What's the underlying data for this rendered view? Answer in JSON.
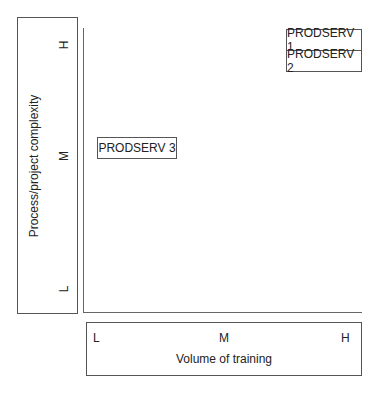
{
  "diagram": {
    "y_axis": {
      "label": "Process/project complexity",
      "ticks": [
        "H",
        "M",
        "L"
      ]
    },
    "x_axis": {
      "label": "Volume of training",
      "ticks": [
        "L",
        "M",
        "H"
      ]
    },
    "items": [
      {
        "label": "PRODSERV 1",
        "x": "H",
        "y": "H"
      },
      {
        "label": "PRODSERV 2",
        "x": "H",
        "y": "H"
      },
      {
        "label": "PRODSERV 3",
        "x": "L",
        "y": "M"
      }
    ]
  }
}
